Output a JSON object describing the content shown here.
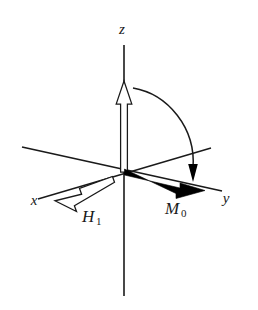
{
  "figure": {
    "background_color": "#ffffff",
    "stroke_color": "#1a1a1a",
    "fill_color": "#000000",
    "hollow_fill": "#ffffff"
  },
  "axes": {
    "z": {
      "label": "z",
      "label_x": 122,
      "label_y": 34
    },
    "x": {
      "label": "x",
      "label_x": 34,
      "label_y": 205
    },
    "y": {
      "label": "y",
      "label_x": 226,
      "label_y": 203
    }
  },
  "vectors": {
    "m0": {
      "label": "M",
      "subscript": "0",
      "label_x": 165,
      "label_y": 214,
      "style": "solid-black-tapered-arrow",
      "description": "equilibrium magnetization along +y"
    },
    "h1": {
      "label": "H",
      "subscript": "1",
      "label_x": 82,
      "label_y": 222,
      "style": "hollow-outlined-arrow",
      "description": "radiofrequency field along -x"
    },
    "mz": {
      "label": "",
      "style": "hollow-outlined-arrow",
      "description": "magnetization along +z"
    }
  },
  "annotations": {
    "rotation_arc": {
      "style": "curved-arrow",
      "description": "rotation of magnetization from z toward y"
    }
  }
}
